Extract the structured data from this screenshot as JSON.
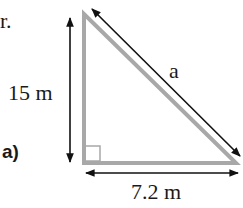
{
  "diagram": {
    "intro_fragment": "r.",
    "part_label": "a)",
    "vertical_side_label": "15 m",
    "horizontal_side_label": "7.2 m",
    "hypotenuse_label": "a",
    "triangle_color": "#a8a8a8",
    "arrow_color": "#111111",
    "shape": "right-triangle",
    "right_angle_marker": true
  }
}
